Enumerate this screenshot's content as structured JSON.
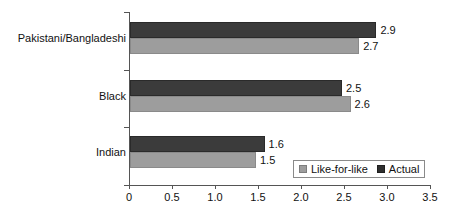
{
  "chart_data": {
    "type": "bar",
    "orientation": "horizontal",
    "title": "",
    "subtitle": "",
    "xlabel": "",
    "ylabel": "",
    "xlim": [
      0,
      3.5
    ],
    "xticks": [
      "0",
      "0.5",
      "1.0",
      "1.5",
      "2.0",
      "2.5",
      "3.0",
      "3.5"
    ],
    "xtick_values": [
      0,
      0.5,
      1.0,
      1.5,
      2.0,
      2.5,
      3.0,
      3.5
    ],
    "grid": false,
    "legend_position": "bottom-right",
    "categories": [
      "Pakistani/Bangladeshi",
      "Black",
      "Indian"
    ],
    "series": [
      {
        "name": "Actual",
        "color": "#3b3b3b",
        "values": [
          2.9,
          2.5,
          1.6
        ],
        "labels": [
          "2.9",
          "2.5",
          "1.6"
        ]
      },
      {
        "name": "Like-for-like",
        "color": "#9d9d9d",
        "values": [
          2.7,
          2.6,
          1.5
        ],
        "labels": [
          "2.7",
          "2.6",
          "1.5"
        ]
      }
    ]
  },
  "legend": {
    "items": [
      {
        "label": "Like-for-like",
        "swatch": "likeforlike"
      },
      {
        "label": "Actual",
        "swatch": "actual"
      }
    ]
  }
}
